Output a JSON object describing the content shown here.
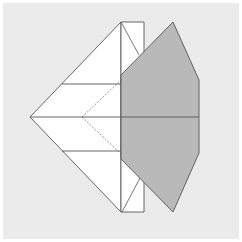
{
  "diagram": {
    "type": "origami-fold-step",
    "colors": {
      "background": "#ebebeb",
      "border": "#ffffff",
      "paper_front": "#ffffff",
      "paper_back": "#b9b9b9",
      "line": "#555555"
    },
    "shapes": {
      "left_kite": "30,117 121,22 121,212",
      "strip": "121,22 144,22 144,212 121,212",
      "gray_flap": "173,22 199,80 199,153 173,212 121,159 121,75"
    },
    "lines": {
      "upper_horizontal": [
        62,
        84,
        121,
        84
      ],
      "lower_horizontal": [
        62,
        151,
        121,
        151
      ],
      "center_horizontal": [
        30,
        117,
        199,
        117
      ],
      "strip_top_diagonal": [
        121,
        22,
        139,
        55
      ],
      "strip_bottom_diagonal": [
        122,
        212,
        140,
        178
      ]
    },
    "dashed_lines": {
      "valley_upper": [
        82,
        117,
        121,
        80
      ],
      "valley_lower": [
        82,
        117,
        121,
        154
      ]
    }
  }
}
